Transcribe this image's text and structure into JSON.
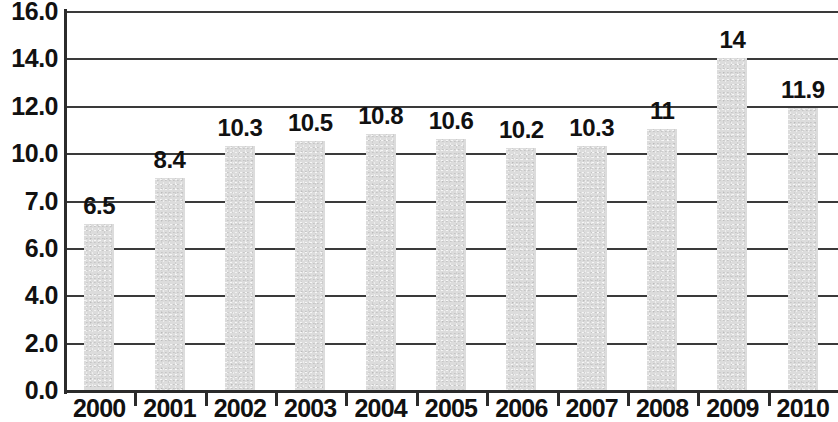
{
  "chart_data": {
    "type": "bar",
    "title": "",
    "subtitle": "",
    "xlabel": "",
    "ylabel": "",
    "categories": [
      "2000",
      "2001",
      "2002",
      "2003",
      "2004",
      "2005",
      "2006",
      "2007",
      "2008",
      "2009",
      "2010"
    ],
    "values": [
      6.5,
      8.4,
      10.3,
      10.5,
      10.8,
      10.6,
      10.2,
      10.3,
      11,
      14,
      11.9
    ],
    "value_labels": [
      "6.5",
      "8.4",
      "10.3",
      "10.5",
      "10.8",
      "10.6",
      "10.2",
      "10.3",
      "11",
      "11.9",
      "14"
    ],
    "data_labels": [
      "6.5",
      "8.4",
      "10.3",
      "10.5",
      "10.8",
      "10.6",
      "10.2",
      "10.3",
      "11",
      "14",
      "11.9"
    ],
    "ylim": [
      0,
      16
    ],
    "y_tick_labels": [
      "0.0",
      "2.0",
      "4.0",
      "6.0",
      "7.0",
      "10.0",
      "12.0",
      "14.0",
      "16.0"
    ],
    "y_tick_values": [
      0,
      2,
      4,
      6,
      7,
      10,
      12,
      14,
      16
    ],
    "grid": true,
    "legend": false,
    "legend_position": "none",
    "bar_color": "#dcdcdc",
    "axis_color": "#2b2b2b",
    "grid_color": "#3a3a3a",
    "text_color": "#111111"
  }
}
